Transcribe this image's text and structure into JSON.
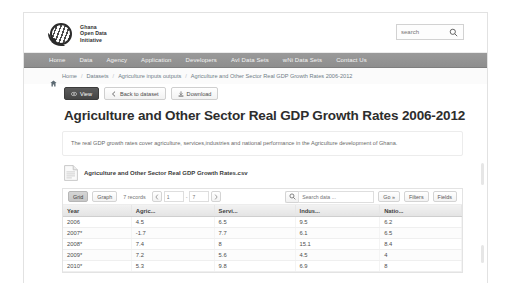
{
  "header": {
    "logo_lines": [
      "Ghana",
      "Open Data",
      "Initiative"
    ],
    "search": {
      "placeholder": "search",
      "value": "",
      "icon": "search-icon"
    }
  },
  "nav": {
    "items": [
      {
        "label": "Home"
      },
      {
        "label": "Data"
      },
      {
        "label": "Agency"
      },
      {
        "label": "Application"
      },
      {
        "label": "Developers"
      },
      {
        "label": "AvI Data Sets"
      },
      {
        "label": "wNi Data Sets"
      },
      {
        "label": "Contact Us"
      }
    ]
  },
  "breadcrumb": {
    "home_icon": "home-icon",
    "items": [
      {
        "label": "Home"
      },
      {
        "label": "Datasets"
      },
      {
        "label": "Agriculture inputs outputs"
      },
      {
        "label": "Agriculture and Other Sector Real GDP Growth Rates 2006-2012"
      }
    ],
    "separator": "/"
  },
  "actions": {
    "view": {
      "label": "View",
      "icon": "eye-icon"
    },
    "back": {
      "label": "Back to dataset",
      "icon": "chevron-left-icon"
    },
    "download": {
      "label": "Download",
      "icon": "download-icon"
    }
  },
  "page_title": "Agriculture and Other Sector Real GDP Growth Rates 2006-2012",
  "description": "The real GDP growth rates cover agriculture, services,industries and national performance in the Agriculture development of Ghana.",
  "resource": {
    "file_icon": "csv-file-icon",
    "file_name": "Agriculture and Other Sector Real GDP Growth Rates.csv"
  },
  "explorer_toolbar": {
    "grid_tab": "Grid",
    "graph_tab": "Graph",
    "record_count": "7 records",
    "prev_icon": "chevron-left-icon",
    "next_icon": "chevron-right-icon",
    "page_from": "1",
    "page_to": "7",
    "range_dash": "-",
    "search_icon": "search-icon",
    "search_placeholder": "Search data ...",
    "search_value": "",
    "go_label": "Go »",
    "filters_label": "Filters",
    "fields_label": "Fields"
  },
  "table": {
    "columns": [
      "Year",
      "Agric...",
      "Servi...",
      "Indus...",
      "Natio..."
    ],
    "rows": [
      [
        "2006",
        "4.5",
        "6.5",
        "9.5",
        "6.2"
      ],
      [
        "2007*",
        "-1.7",
        "7.7",
        "6.1",
        "6.5"
      ],
      [
        "2008*",
        "7.4",
        "8",
        "15.1",
        "8.4"
      ],
      [
        "2009*",
        "7.2",
        "5.6",
        "4.5",
        "4"
      ],
      [
        "2010*",
        "5.3",
        "9.8",
        "6.9",
        "8"
      ]
    ]
  },
  "colors": {
    "nav_bar": "#8e8e8e",
    "primary_button": "#454545",
    "breadcrumb_text": "#6f7d86"
  }
}
